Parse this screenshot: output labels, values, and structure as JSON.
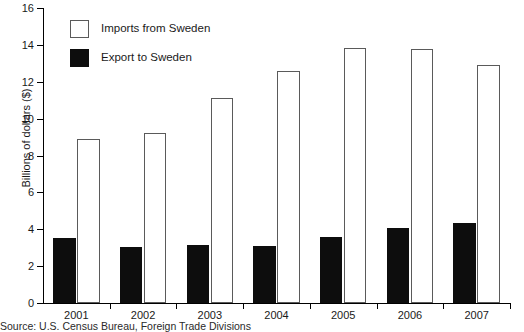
{
  "chart_data": {
    "type": "bar",
    "title": "",
    "xlabel": "",
    "ylabel": "Billions of dollars ($)",
    "categories": [
      "2001",
      "2002",
      "2003",
      "2004",
      "2005",
      "2006",
      "2007"
    ],
    "series": [
      {
        "name": "Imports from Sweden",
        "values": [
          8.9,
          9.2,
          11.1,
          12.6,
          13.85,
          13.8,
          12.9
        ],
        "color": "#ffffff",
        "border_color": "#5a5a5a"
      },
      {
        "name": "Export to Sweden",
        "values": [
          3.5,
          3.05,
          3.15,
          3.1,
          3.6,
          4.05,
          4.35
        ],
        "color": "#0d0d0d",
        "border_color": "#0d0d0d"
      }
    ],
    "ylim": [
      0,
      16
    ],
    "ytick_step": 2,
    "yticks": [
      "0",
      "2",
      "4",
      "6",
      "8",
      "10",
      "12",
      "14",
      "16"
    ],
    "grid": false,
    "legend_position": "top-left"
  },
  "legend": {
    "items": [
      {
        "label": "Imports from Sweden",
        "swatch": "imports"
      },
      {
        "label": "Export to Sweden",
        "swatch": "exports"
      }
    ]
  },
  "footer": {
    "source": "Source: U.S. Census Bureau, Foreign Trade Divisions"
  }
}
